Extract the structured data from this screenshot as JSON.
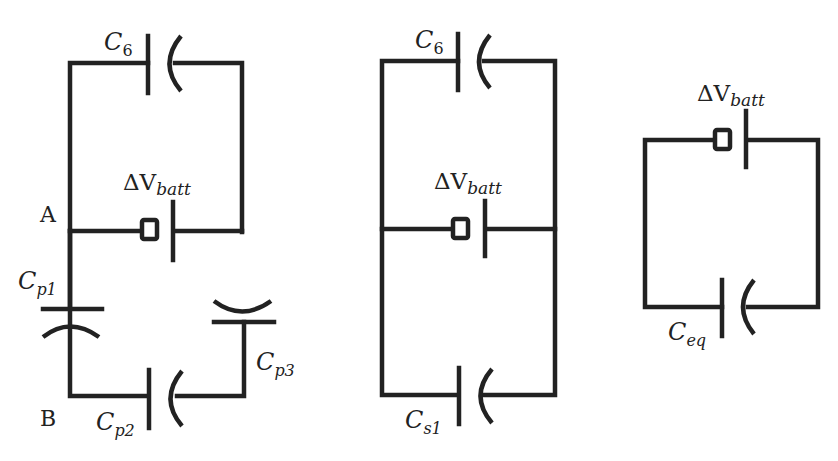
{
  "diagram": {
    "type": "capacitor circuit reduction",
    "stroke_color": "#222222",
    "background": "#ffffff",
    "circuits": [
      {
        "id": "circuit-1",
        "nodes": {
          "a": "A",
          "b": "B"
        },
        "capacitors": [
          {
            "id": "c6",
            "symbol": "C",
            "sub": "6"
          },
          {
            "id": "cp1",
            "symbol": "C",
            "sub": "p1"
          },
          {
            "id": "cp2",
            "symbol": "C",
            "sub": "p2"
          },
          {
            "id": "cp3",
            "symbol": "C",
            "sub": "p3"
          }
        ],
        "battery": {
          "symbol": "ΔV",
          "sub": "batt"
        }
      },
      {
        "id": "circuit-2",
        "capacitors": [
          {
            "id": "c6",
            "symbol": "C",
            "sub": "6"
          },
          {
            "id": "cs1",
            "symbol": "C",
            "sub": "s1"
          }
        ],
        "battery": {
          "symbol": "ΔV",
          "sub": "batt"
        }
      },
      {
        "id": "circuit-3",
        "capacitors": [
          {
            "id": "ceq",
            "symbol": "C",
            "sub": "eq"
          }
        ],
        "battery": {
          "symbol": "ΔV",
          "sub": "batt"
        }
      }
    ]
  }
}
